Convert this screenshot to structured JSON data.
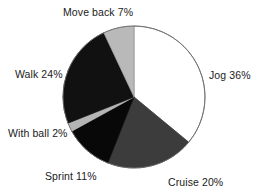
{
  "chart_data": {
    "type": "pie",
    "title": "",
    "subtitle": "",
    "xlabel": "",
    "ylabel": "",
    "legend_position": "none",
    "grid": false,
    "units": "percent",
    "start_angle_deg": 0,
    "direction": "clockwise",
    "categories": [
      "Jog",
      "Cruise",
      "Sprint",
      "With ball",
      "Walk",
      "Move back"
    ],
    "values": [
      36,
      20,
      11,
      2,
      24,
      7
    ],
    "labels": [
      "Jog 36%",
      "Cruise 20%",
      "Sprint 11%",
      "With ball 2%",
      "Walk 24%",
      "Move back 7%"
    ],
    "slices": [
      {
        "name": "Jog",
        "label": "Jog 36%",
        "value": 36,
        "color": "#ffffff",
        "stroke": "#6b6b6b"
      },
      {
        "name": "Cruise",
        "label": "Cruise 20%",
        "value": 20,
        "color": "#3c3c3c",
        "stroke": "#3c3c3c"
      },
      {
        "name": "Sprint",
        "label": "Sprint 11%",
        "value": 11,
        "color": "#080808",
        "stroke": "#080808"
      },
      {
        "name": "With ball",
        "label": "With ball 2%",
        "value": 2,
        "color": "#b4b4b4",
        "stroke": "#b4b4b4"
      },
      {
        "name": "Walk",
        "label": "Walk 24%",
        "value": 24,
        "color": "#111111",
        "stroke": "#111111"
      },
      {
        "name": "Move back",
        "label": "Move back 7%",
        "value": 7,
        "color": "#b9b9b9",
        "stroke": "#9a9a9a"
      }
    ],
    "geometry": {
      "cx": 134,
      "cy": 97,
      "r": 71
    },
    "colors": {
      "jog": "#ffffff",
      "cruise": "#3c3c3c",
      "sprint": "#080808",
      "with_ball": "#b4b4b4",
      "walk": "#111111",
      "move_back": "#b9b9b9",
      "outline": "#6b6b6b",
      "text": "#1a1a1a",
      "background": "#ffffff"
    }
  }
}
